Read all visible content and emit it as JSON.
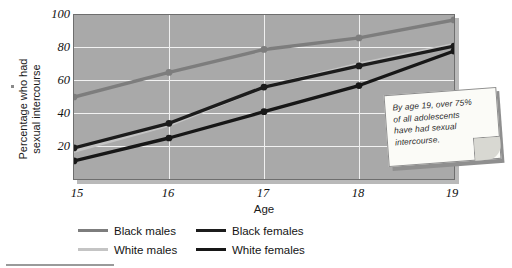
{
  "chart_data": {
    "type": "line",
    "title": "",
    "xlabel": "Age",
    "ylabel": "Percentage who had sexual intercourse",
    "ylabel_line1": "Percentage who had",
    "ylabel_line2": "sexual intercourse",
    "categories": [
      "15",
      "16",
      "17",
      "18",
      "19"
    ],
    "x": [
      15,
      16,
      17,
      18,
      19
    ],
    "xlim": [
      15,
      19
    ],
    "ylim": [
      0,
      100
    ],
    "yticks": [
      100,
      80,
      60,
      40,
      20
    ],
    "xticks": [
      "15",
      "16",
      "17",
      "18",
      "19"
    ],
    "grid": true,
    "legend_position": "bottom-left",
    "series": [
      {
        "name": "Black males",
        "values": [
          50,
          65,
          79,
          86,
          97
        ],
        "color": "#7d7d7d",
        "marker": true
      },
      {
        "name": "White males",
        "values": [
          17,
          33,
          56,
          70,
          82
        ],
        "color": "#c4c4c4",
        "marker": false
      },
      {
        "name": "Black females",
        "values": [
          19,
          34,
          56,
          69,
          81
        ],
        "color": "#1c1c1c",
        "marker": true
      },
      {
        "name": "White females",
        "values": [
          11,
          25,
          41,
          57,
          78
        ],
        "color": "#171717",
        "marker": true
      }
    ],
    "annotations": [
      {
        "name": "callout-note",
        "text": "By age 19, over 75% of all adolescents have had sexual intercourse.",
        "lines": [
          "By age 19, over 75%",
          "of all adolescents",
          "have had sexual",
          "intercourse."
        ]
      }
    ]
  },
  "legend": {
    "items": [
      {
        "label": "Black males",
        "color": "#7d7d7d"
      },
      {
        "label": "Black females",
        "color": "#1c1c1c"
      },
      {
        "label": "White males",
        "color": "#c4c4c4"
      },
      {
        "label": "White females",
        "color": "#171717"
      }
    ]
  },
  "colors": {
    "plot_background": "#a9a9a9",
    "gridline": "#f2f2f2",
    "page_background": "#ffffff",
    "note_background": "#fbfbf7"
  }
}
